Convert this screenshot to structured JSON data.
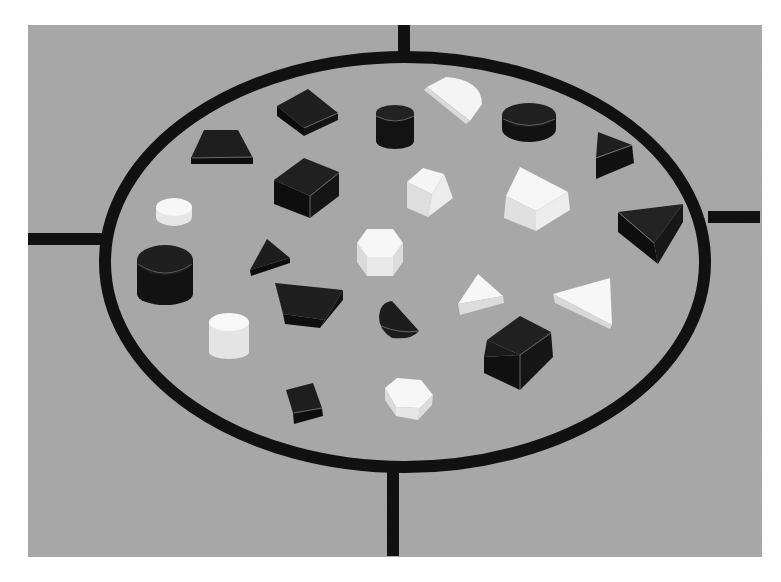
{
  "scene": {
    "title": "Geometric attribute blocks arranged inside a black ellipse on a gray board",
    "background": "#ffffff",
    "board_color": "#a9a9a9",
    "ring_color": "#111111",
    "dark_block_color": "#1a1a1a",
    "light_block_color": "#f2f2f2",
    "board_bounds": [
      28,
      25,
      762,
      557
    ],
    "ellipse": {
      "cx": 405,
      "cy": 262,
      "rx": 300,
      "ry": 205,
      "stroke_width": 12
    },
    "spokes": [
      {
        "name": "top",
        "from": [
          404,
          25
        ],
        "to": [
          404,
          58
        ]
      },
      {
        "name": "bottom",
        "from": [
          393,
          466
        ],
        "to": [
          393,
          556
        ]
      },
      {
        "name": "left",
        "from": [
          28,
          239
        ],
        "to": [
          103,
          239
        ]
      },
      {
        "name": "right",
        "from": [
          710,
          217
        ],
        "to": [
          760,
          217
        ]
      }
    ],
    "blocks": [
      {
        "shape": "trapezoid",
        "color": "dark",
        "pos": [
          222,
          148
        ]
      },
      {
        "shape": "square",
        "color": "dark",
        "pos": [
          306,
          112
        ]
      },
      {
        "shape": "cylinder",
        "color": "dark",
        "pos": [
          394,
          128
        ]
      },
      {
        "shape": "half-disc",
        "color": "light",
        "pos": [
          456,
          96
        ]
      },
      {
        "shape": "cylinder",
        "color": "dark",
        "pos": [
          528,
          122
        ]
      },
      {
        "shape": "triangle",
        "color": "dark",
        "pos": [
          612,
          153
        ]
      },
      {
        "shape": "square",
        "color": "dark",
        "pos": [
          305,
          186
        ]
      },
      {
        "shape": "square",
        "color": "light",
        "pos": [
          430,
          192
        ]
      },
      {
        "shape": "trapezoid",
        "color": "light",
        "pos": [
          538,
          200
        ]
      },
      {
        "shape": "cylinder",
        "color": "light",
        "pos": [
          173,
          211
        ]
      },
      {
        "shape": "triangle",
        "color": "dark",
        "pos": [
          650,
          230
        ]
      },
      {
        "shape": "hexagon",
        "color": "light",
        "pos": [
          380,
          252
        ]
      },
      {
        "shape": "triangle",
        "color": "dark",
        "pos": [
          268,
          258
        ]
      },
      {
        "shape": "cylinder",
        "color": "dark",
        "pos": [
          164,
          275
        ]
      },
      {
        "shape": "trapezoid",
        "color": "dark",
        "pos": [
          308,
          302
        ]
      },
      {
        "shape": "triangle",
        "color": "light",
        "pos": [
          480,
          296
        ]
      },
      {
        "shape": "triangle",
        "color": "light",
        "pos": [
          588,
          298
        ]
      },
      {
        "shape": "half-disc",
        "color": "dark",
        "pos": [
          398,
          320
        ]
      },
      {
        "shape": "cylinder",
        "color": "light",
        "pos": [
          230,
          332
        ]
      },
      {
        "shape": "square",
        "color": "dark",
        "pos": [
          518,
          352
        ]
      },
      {
        "shape": "square",
        "color": "dark",
        "pos": [
          309,
          402
        ]
      },
      {
        "shape": "hexagon",
        "color": "light",
        "pos": [
          408,
          399
        ]
      }
    ]
  }
}
